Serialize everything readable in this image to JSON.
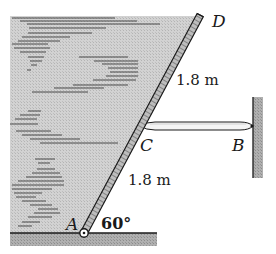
{
  "figure": {
    "points": {
      "A": "A",
      "B": "B",
      "C": "C",
      "D": "D"
    },
    "dimensions": {
      "upper_segment": "1.8 m",
      "lower_segment": "1.8 m"
    },
    "angle": "60°"
  },
  "colors": {
    "shade": "#c8c8c8",
    "ground": "#a9a9a9",
    "wall": "#a9a9a9",
    "line": "#1a1a1a",
    "hatch": "#6a6a6a",
    "strut": "#f2f2f2"
  }
}
